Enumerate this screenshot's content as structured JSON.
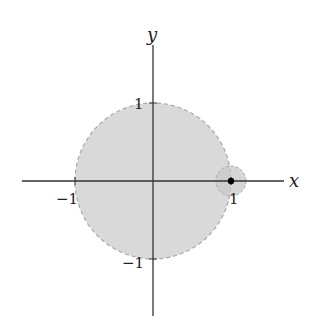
{
  "diagram": {
    "axes": {
      "x_label": "x",
      "y_label": "y",
      "ticks": {
        "x_neg": "−1",
        "x_pos": "1",
        "y_pos": "1",
        "y_neg": "−1"
      }
    },
    "unit_disk": {
      "center": [
        0,
        0
      ],
      "radius": 1,
      "fill": "#d9d9d9",
      "stroke": "#a8a8a8",
      "stroke_style": "dashed"
    },
    "small_disk": {
      "center": [
        1,
        0
      ],
      "radius": 0.2,
      "fill": "#cfcfcf",
      "stroke": "#a8a8a8",
      "stroke_style": "dashed"
    },
    "point": {
      "at": [
        1,
        0
      ],
      "color": "#000000"
    },
    "axis_color": "#333333"
  }
}
